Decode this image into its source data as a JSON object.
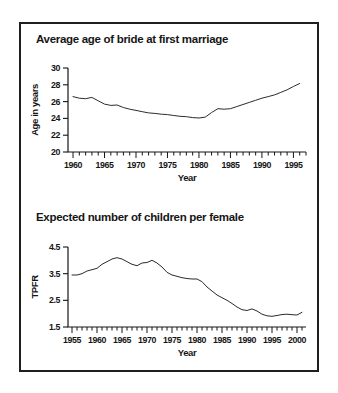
{
  "style": {
    "background": "#ffffff",
    "frame_color": "#1f1f1f",
    "text_color": "#161616",
    "line_color": "#2b2b2b"
  },
  "chart_data": [
    {
      "type": "line",
      "title": "Average age of bride at first marriage",
      "xlabel": "Year",
      "ylabel": "Age in years",
      "x": [
        1960,
        1961,
        1962,
        1963,
        1964,
        1965,
        1966,
        1967,
        1968,
        1969,
        1970,
        1971,
        1972,
        1973,
        1974,
        1975,
        1976,
        1977,
        1978,
        1979,
        1980,
        1981,
        1982,
        1983,
        1984,
        1985,
        1986,
        1987,
        1988,
        1989,
        1990,
        1991,
        1992,
        1993,
        1994,
        1995,
        1996
      ],
      "values": [
        26.6,
        26.4,
        26.35,
        26.5,
        26.1,
        25.7,
        25.55,
        25.6,
        25.3,
        25.1,
        24.95,
        24.8,
        24.65,
        24.6,
        24.5,
        24.45,
        24.35,
        24.25,
        24.2,
        24.1,
        24.05,
        24.15,
        24.7,
        25.15,
        25.1,
        25.15,
        25.4,
        25.65,
        25.9,
        26.15,
        26.4,
        26.6,
        26.8,
        27.1,
        27.4,
        27.8,
        28.15
      ],
      "xlim": [
        1959.2,
        1997
      ],
      "ylim": [
        20,
        30
      ],
      "xticks": [
        1960,
        1965,
        1970,
        1975,
        1980,
        1985,
        1990,
        1995
      ],
      "yticks": [
        20,
        22,
        24,
        26,
        28,
        30
      ],
      "minor_tick_step": 1,
      "grid": false,
      "legend": "none"
    },
    {
      "type": "line",
      "title": "Expected number of children per female",
      "xlabel": "Year",
      "ylabel": "TPFR",
      "x": [
        1955,
        1956,
        1957,
        1958,
        1959,
        1960,
        1961,
        1962,
        1963,
        1964,
        1965,
        1966,
        1967,
        1968,
        1969,
        1970,
        1971,
        1972,
        1973,
        1974,
        1975,
        1976,
        1977,
        1978,
        1979,
        1980,
        1981,
        1982,
        1983,
        1984,
        1985,
        1986,
        1987,
        1988,
        1989,
        1990,
        1991,
        1992,
        1993,
        1994,
        1995,
        1996,
        1997,
        1998,
        1999,
        2000,
        2001
      ],
      "values": [
        3.45,
        3.45,
        3.5,
        3.6,
        3.65,
        3.7,
        3.85,
        3.95,
        4.05,
        4.1,
        4.05,
        3.95,
        3.85,
        3.8,
        3.9,
        3.92,
        4.0,
        3.9,
        3.75,
        3.55,
        3.45,
        3.4,
        3.35,
        3.32,
        3.3,
        3.3,
        3.2,
        3.0,
        2.85,
        2.7,
        2.6,
        2.5,
        2.38,
        2.25,
        2.15,
        2.12,
        2.18,
        2.1,
        1.98,
        1.92,
        1.9,
        1.93,
        1.97,
        1.98,
        1.96,
        1.95,
        2.05
      ],
      "xlim": [
        1954.2,
        2001.8
      ],
      "ylim": [
        1.5,
        4.5
      ],
      "xticks": [
        1955,
        1960,
        1965,
        1970,
        1975,
        1980,
        1985,
        1990,
        1995,
        2000
      ],
      "yticks": [
        1.5,
        2.5,
        3.5,
        4.5
      ],
      "minor_tick_step": 1,
      "grid": false,
      "legend": "none"
    }
  ]
}
